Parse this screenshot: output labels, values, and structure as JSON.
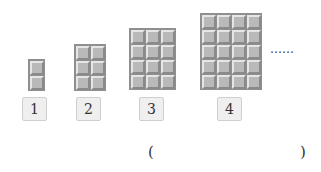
{
  "figures": [
    {
      "label": "1",
      "cols": 1,
      "rows": 2
    },
    {
      "label": "2",
      "cols": 2,
      "rows": 3
    },
    {
      "label": "3",
      "cols": 3,
      "rows": 4
    },
    {
      "label": "4",
      "cols": 4,
      "rows": 5
    }
  ],
  "continuation": "……",
  "answer": {
    "open": "(",
    "close": ")",
    "value": ""
  },
  "colors": {
    "tile": "#b9b9b9",
    "tile_border": "#8f8f8f",
    "label_bg": "#efefef"
  }
}
